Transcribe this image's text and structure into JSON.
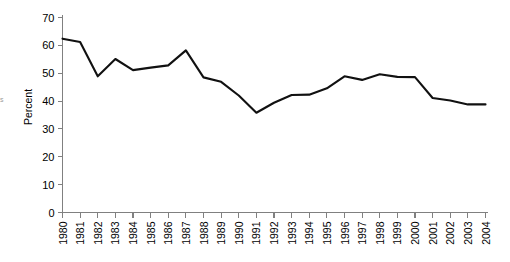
{
  "chart_data": {
    "type": "line",
    "title": "",
    "xlabel": "",
    "ylabel": "Percent",
    "ylim": [
      0,
      70
    ],
    "ytick_values": [
      0,
      10,
      20,
      30,
      40,
      50,
      60,
      70
    ],
    "ytick_labels": [
      "0",
      "10",
      "20",
      "30",
      "40",
      "50",
      "60",
      "70"
    ],
    "grid": false,
    "legend": "none",
    "categories": [
      "1980",
      "1981",
      "1982",
      "1983",
      "1984",
      "1985",
      "1986",
      "1987",
      "1988",
      "1989",
      "1990",
      "1991",
      "1992",
      "1993",
      "1994",
      "1995",
      "1996",
      "1997",
      "1998",
      "1999",
      "2000",
      "2001",
      "2002",
      "2003",
      "2004"
    ],
    "series": [
      {
        "name": "Percent",
        "color": "#111111",
        "values": [
          62.4,
          61.2,
          48.9,
          55.1,
          51.1,
          52.0,
          52.8,
          58.2,
          48.5,
          46.9,
          42.0,
          35.8,
          39.4,
          42.2,
          42.3,
          44.6,
          48.9,
          47.6,
          49.6,
          48.7,
          48.6,
          41.1,
          40.2,
          38.8,
          38.8
        ]
      }
    ]
  },
  "edge_mark": "s"
}
